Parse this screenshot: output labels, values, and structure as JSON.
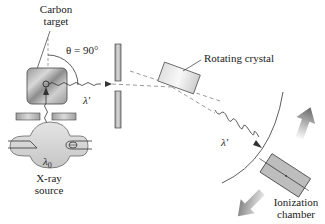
{
  "diagram": {
    "labels": {
      "carbon_target_line1": "Carbon",
      "carbon_target_line2": "target",
      "theta": "θ = 90°",
      "scattered_wavelength_1": "λ′",
      "scattered_wavelength_2": "λ′",
      "incident_wavelength": "λ",
      "incident_wavelength_sub": "0",
      "xray_source_line1": "X-ray",
      "xray_source_line2": "source",
      "rotating_crystal": "Rotating crystal",
      "ionization_chamber_line1": "Ionization",
      "ionization_chamber_line2": "chamber"
    },
    "components": [
      {
        "name": "X-ray source",
        "type": "tube"
      },
      {
        "name": "Collimator slits (lower)",
        "type": "slit-pair"
      },
      {
        "name": "Carbon target",
        "type": "block"
      },
      {
        "name": "Collimator slits (scattered beam)",
        "type": "slit-pair"
      },
      {
        "name": "Rotating crystal",
        "type": "crystal"
      },
      {
        "name": "Ionization chamber",
        "type": "detector"
      }
    ],
    "colors": {
      "line": "#333333",
      "fill_gray": "#b8b8b8",
      "arrow_gray": "#707070",
      "dashed": "#555555"
    }
  }
}
